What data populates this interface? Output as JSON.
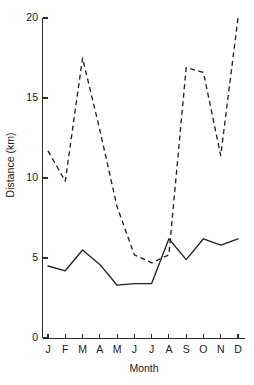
{
  "chart_data": {
    "type": "line",
    "title": "",
    "xlabel": "Month",
    "ylabel": "Distance (km)",
    "categories": [
      "J",
      "F",
      "M",
      "A",
      "M",
      "J",
      "J",
      "A",
      "S",
      "O",
      "N",
      "D"
    ],
    "x": [
      "J",
      "F",
      "M",
      "A",
      "M",
      "J",
      "J",
      "A",
      "S",
      "O",
      "N",
      "D"
    ],
    "xlim": [
      0,
      11
    ],
    "ylim": [
      0,
      20
    ],
    "yticks": [
      0,
      5,
      10,
      15,
      20
    ],
    "ytick_labels": [
      "0",
      "5",
      "10",
      "15",
      "20"
    ],
    "xtick_labels": [
      "J",
      "F",
      "M",
      "A",
      "M",
      "J",
      "J",
      "A",
      "S",
      "O",
      "N",
      "D"
    ],
    "grid": false,
    "legend": false,
    "legend_position": "none",
    "series": [
      {
        "name": "dashed-series",
        "style": "dashed",
        "color": "#232323",
        "values": [
          11.7,
          9.8,
          17.5,
          13.0,
          8.2,
          5.2,
          4.7,
          5.2,
          16.9,
          16.6,
          11.4,
          20.0
        ]
      },
      {
        "name": "solid-series",
        "style": "solid",
        "color": "#232323",
        "values": [
          4.5,
          4.2,
          5.5,
          4.6,
          3.3,
          3.4,
          3.4,
          6.2,
          4.9,
          6.2,
          5.8,
          6.2
        ]
      }
    ],
    "annotations": []
  },
  "axes": {
    "y_axis_label": "Distance (km)",
    "x_axis_label": "Month"
  }
}
